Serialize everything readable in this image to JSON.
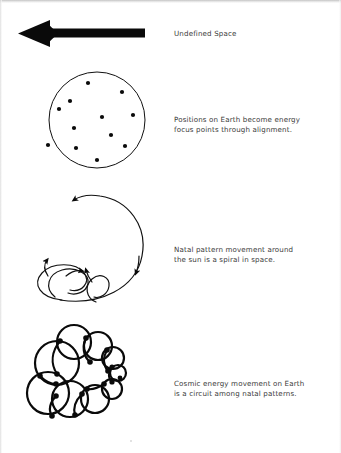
{
  "page": {
    "width": 341,
    "height": 453,
    "background": "#ffffff",
    "ink_color": "#000000",
    "text_color": "#3a3a3a"
  },
  "rows": [
    {
      "id": "undefined-space",
      "figure": "left-arrow",
      "caption": "Undefined Space"
    },
    {
      "id": "positions-on-earth",
      "figure": "dotted-circle",
      "caption": "Positions on Earth become energy\nfocus points through alignment."
    },
    {
      "id": "natal-pattern-spiral",
      "figure": "spiral-with-loops",
      "caption": "Natal pattern movement around\nthe sun is a spiral in space."
    },
    {
      "id": "cosmic-energy-circuit",
      "figure": "overlapping-circle-rosette",
      "caption": "Cosmic energy movement on Earth\nis a circuit among natal patterns."
    }
  ],
  "figures": {
    "left_arrow": {
      "name": "left-arrow",
      "shaft_from_x": 145,
      "shaft_to_x": 46,
      "shaft_y": 33,
      "shaft_thickness": 9,
      "head_tip_x": 18,
      "head_half_height": 13
    },
    "dotted_circle": {
      "name": "dotted-circle",
      "center_x": 97,
      "center_y": 120,
      "radius": 48,
      "stroke_width": 1,
      "dot_radius": 2.1,
      "dot_count": 12,
      "dots": [
        [
          88,
          83
        ],
        [
          122,
          92
        ],
        [
          70,
          101
        ],
        [
          59,
          109
        ],
        [
          133,
          115
        ],
        [
          74,
          128
        ],
        [
          111,
          135
        ],
        [
          48,
          145
        ],
        [
          76,
          148
        ],
        [
          125,
          146
        ],
        [
          97,
          160
        ],
        [
          102,
          117
        ]
      ]
    },
    "spiral": {
      "name": "spiral-with-loops",
      "arrow_marker_count": 4,
      "stroke_width": 1.2
    },
    "rosette": {
      "name": "overlapping-circle-rosette",
      "stroke_width": 2.2,
      "node_radius": 2.6,
      "circles": [
        {
          "cx": 57,
          "cy": 363,
          "r": 22
        },
        {
          "cx": 73,
          "cy": 342,
          "r": 17
        },
        {
          "cx": 97,
          "cy": 345,
          "r": 14
        },
        {
          "cx": 113,
          "cy": 357,
          "r": 11
        },
        {
          "cx": 118,
          "cy": 372,
          "r": 8
        },
        {
          "cx": 112,
          "cy": 388,
          "r": 10
        },
        {
          "cx": 95,
          "cy": 398,
          "r": 14
        },
        {
          "cx": 72,
          "cy": 398,
          "r": 18
        },
        {
          "cx": 50,
          "cy": 393,
          "r": 21
        },
        {
          "cx": 88,
          "cy": 367,
          "r": 13
        }
      ]
    }
  }
}
